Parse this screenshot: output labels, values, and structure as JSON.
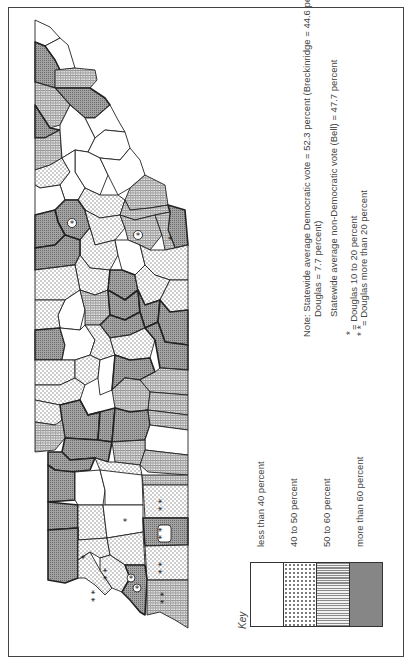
{
  "map": {
    "subject": "Tennessee counties, rotated (east at top, west at bottom)",
    "colors": {
      "border": "#222222",
      "less_than_40": "#ffffff",
      "40_to_50": "#e6e6e6",
      "50_to_60": "#c4c4c4",
      "more_than_60": "#9a9a9a"
    },
    "douglas_markers": {
      "single": "*",
      "double": "* *"
    }
  },
  "legend": {
    "title": "Key",
    "items": [
      {
        "label": "less than 40 percent",
        "pattern": "white"
      },
      {
        "label": "40 to  50 percent",
        "pattern": "dots"
      },
      {
        "label": "50 to 60 percent",
        "pattern": "fine"
      },
      {
        "label": "more than 60 percent",
        "pattern": "dark"
      }
    ]
  },
  "notes": {
    "line1": "Note: Statewide average Democratic vote = 52.3 percent (Breckinridge = 44.6 percent,",
    "line2": "Douglas = 7.7 percent)",
    "line3": "Statewide average non-Democratic vote (Bell) = 47.7 percent",
    "single_star_symbol": "*",
    "single_star_text": "= Douglas 10 to 20 percent",
    "double_star_symbol": "* *",
    "double_star_text": "= Douglas more than 20 percent"
  }
}
